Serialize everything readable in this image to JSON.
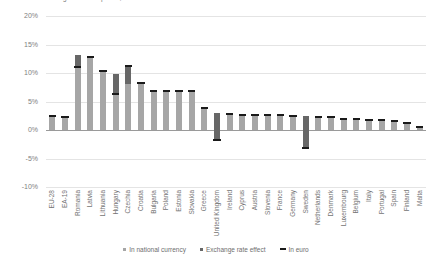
{
  "chart_data": {
    "type": "bar",
    "title": "Change in house prices, 2015-2019",
    "xlabel": "",
    "ylabel": "",
    "ylim": [
      -10,
      20
    ],
    "ytick_labels": [
      "20%",
      "15%",
      "10%",
      "5%",
      "0%",
      "-5%",
      "-10%"
    ],
    "yticks": [
      20,
      15,
      10,
      5,
      0,
      -5,
      -10
    ],
    "grid": true,
    "legend_position": "bottom",
    "legend": [
      "In national currency",
      "Exchange rate effect",
      "In euro"
    ],
    "series_names": [
      "In national currency",
      "Exchange rate effect",
      "In euro"
    ],
    "categories": [
      "EU-28",
      "EA-19",
      "Romania",
      "Latvia",
      "Lithuania",
      "Hungary",
      "Czechia",
      "Croatia",
      "Bulgaria",
      "Poland",
      "Estonia",
      "Slovakia",
      "Greece",
      "United Kingdom",
      "Ireland",
      "Cyprus",
      "Austria",
      "Slovenia",
      "France",
      "Germany",
      "Sweden",
      "Netherlands",
      "Denmark",
      "Luxembourg",
      "Belgium",
      "Italy",
      "Portugal",
      "Spain",
      "Finland",
      "Malta"
    ],
    "series": [
      {
        "name": "In national currency",
        "values": [
          2.5,
          2.2,
          13.2,
          12.8,
          10.4,
          9.8,
          8.1,
          8.2,
          6.8,
          6.8,
          6.8,
          6.8,
          3.9,
          3.0,
          2.8,
          2.7,
          2.7,
          2.6,
          2.6,
          2.5,
          2.4,
          2.3,
          2.2,
          2.0,
          1.9,
          1.8,
          1.7,
          1.5,
          1.3,
          0.6
        ]
      },
      {
        "name": "Exchange rate effect",
        "values": [
          0.0,
          0.0,
          -2.1,
          0.0,
          0.0,
          -3.5,
          3.2,
          0.0,
          0.0,
          0.0,
          0.0,
          0.0,
          0.0,
          -4.8,
          0.0,
          0.0,
          0.0,
          0.0,
          0.0,
          0.0,
          -5.6,
          0.0,
          0.0,
          0.0,
          0.0,
          0.0,
          0.0,
          0.0,
          0.0,
          0.0
        ]
      },
      {
        "name": "In euro",
        "values": [
          2.5,
          2.2,
          11.1,
          12.8,
          10.4,
          6.3,
          11.3,
          8.2,
          6.8,
          6.8,
          6.8,
          6.8,
          3.9,
          -1.8,
          2.8,
          2.7,
          2.7,
          2.6,
          2.6,
          2.5,
          -3.2,
          2.3,
          2.2,
          2.0,
          1.9,
          1.8,
          1.7,
          1.5,
          1.3,
          0.6
        ]
      }
    ]
  },
  "colors": {
    "national_currency": "#a6a6a6",
    "exchange_rate_effect": "#676767",
    "in_euro": "#1a1a1a",
    "gridline": "#e4e4e4",
    "zeroline": "#9a9a9a",
    "text": "#737373"
  }
}
